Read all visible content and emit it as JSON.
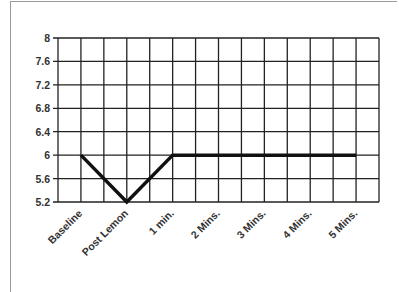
{
  "chart_data": {
    "type": "line",
    "title": "",
    "xlabel": "",
    "ylabel": "",
    "categories": [
      "Baseline",
      "Post Lemon",
      "1 min.",
      "2 Mins.",
      "3 Mins.",
      "4 Mins.",
      "5 Mins."
    ],
    "series": [
      {
        "name": "pH",
        "values": [
          6,
          5.2,
          6,
          6,
          6,
          6,
          6
        ]
      }
    ],
    "ylim": [
      5.2,
      8
    ],
    "yticks": [
      "8",
      "7.6",
      "7.2",
      "6.8",
      "6.4",
      "6",
      "5.6",
      "5.2"
    ],
    "grid": true,
    "legend": "none",
    "line_color": "#111111",
    "grid_color": "#222222"
  }
}
